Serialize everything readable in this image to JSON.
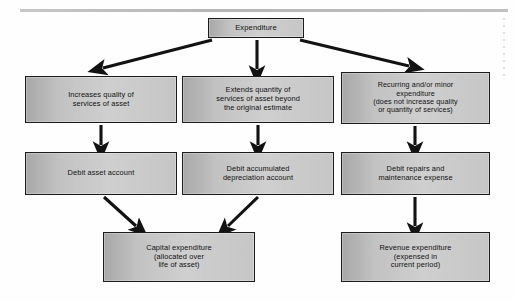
{
  "diagram": {
    "style": {
      "box_fill_left": "#a8a8a8",
      "box_fill_right": "#cfcfcf",
      "box_border": "#1c1c1c",
      "arrow_color": "#121212",
      "background": "#ffffff",
      "rule_color": "#b5b5b5"
    },
    "nodes": [
      {
        "id": "expenditure",
        "label": "Expenditure"
      },
      {
        "id": "increases",
        "label": "Increases quality of\nservices of asset"
      },
      {
        "id": "extends",
        "label": "Extends quantity of\nservices of asset beyond\nthe original estimate"
      },
      {
        "id": "recurring",
        "label": "Recurring and/or minor\nexpenditure\n(does not increase quality\nor quantity of services)"
      },
      {
        "id": "debit_asset",
        "label": "Debit asset account"
      },
      {
        "id": "debit_accum",
        "label": "Debit accumulated\ndepreciation account"
      },
      {
        "id": "debit_repairs",
        "label": "Debit repairs and\nmaintenance expense"
      },
      {
        "id": "capital",
        "label": "Capital expenditure\n(allocated over\nlife of asset)"
      },
      {
        "id": "revenue",
        "label": "Revenue expenditure\n(expensed in\ncurrent period)"
      }
    ],
    "edges": [
      {
        "from": "expenditure",
        "to": "increases",
        "kind": "diagonal-left"
      },
      {
        "from": "expenditure",
        "to": "extends",
        "kind": "vertical"
      },
      {
        "from": "expenditure",
        "to": "recurring",
        "kind": "diagonal-right"
      },
      {
        "from": "increases",
        "to": "debit_asset",
        "kind": "vertical"
      },
      {
        "from": "extends",
        "to": "debit_accum",
        "kind": "vertical"
      },
      {
        "from": "recurring",
        "to": "debit_repairs",
        "kind": "vertical"
      },
      {
        "from": "debit_asset",
        "to": "capital",
        "kind": "diagonal-right"
      },
      {
        "from": "debit_accum",
        "to": "capital",
        "kind": "diagonal-left"
      },
      {
        "from": "debit_repairs",
        "to": "revenue",
        "kind": "vertical"
      }
    ]
  }
}
